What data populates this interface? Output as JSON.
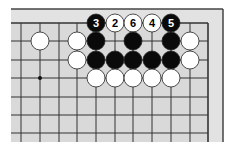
{
  "diagram": {
    "type": "go-board-fragment",
    "colors": {
      "page_bg": "#ffffff",
      "board_bg": "#d9d9d9",
      "margin_bg": "#e2e2e2",
      "grid_line": "#333333",
      "frame_line": "#444444",
      "black_stone": "#0a0a0a",
      "white_stone": "#ffffff",
      "stone_outline": "#222222"
    },
    "geometry": {
      "col_x": [
        21,
        40,
        59,
        77,
        96,
        115,
        133,
        152,
        171,
        190,
        208
      ],
      "row_y": [
        23,
        41,
        60,
        78,
        97,
        115,
        133
      ],
      "stone_radius": 9,
      "board_left": 11,
      "board_top": 9,
      "board_right": 223,
      "board_bottom": 142,
      "grid_bottom": 142
    },
    "edges": {
      "top": true,
      "right": true
    },
    "hoshi": [
      {
        "col": 1,
        "row": 3
      }
    ],
    "stones": [
      {
        "col": 4,
        "row": 0,
        "color": "black",
        "label": "3"
      },
      {
        "col": 5,
        "row": 0,
        "color": "white",
        "label": "2"
      },
      {
        "col": 6,
        "row": 0,
        "color": "white",
        "label": "6"
      },
      {
        "col": 7,
        "row": 0,
        "color": "white",
        "label": "4"
      },
      {
        "col": 8,
        "row": 0,
        "color": "black",
        "label": "5"
      },
      {
        "col": 1,
        "row": 1,
        "color": "white",
        "label": ""
      },
      {
        "col": 3,
        "row": 1,
        "color": "white",
        "label": ""
      },
      {
        "col": 4,
        "row": 1,
        "color": "black",
        "label": ""
      },
      {
        "col": 6,
        "row": 1,
        "color": "black",
        "label": ""
      },
      {
        "col": 8,
        "row": 1,
        "color": "black",
        "label": ""
      },
      {
        "col": 9,
        "row": 1,
        "color": "white",
        "label": ""
      },
      {
        "col": 3,
        "row": 2,
        "color": "white",
        "label": ""
      },
      {
        "col": 4,
        "row": 2,
        "color": "black",
        "label": ""
      },
      {
        "col": 5,
        "row": 2,
        "color": "black",
        "label": ""
      },
      {
        "col": 6,
        "row": 2,
        "color": "black",
        "label": ""
      },
      {
        "col": 7,
        "row": 2,
        "color": "black",
        "label": ""
      },
      {
        "col": 8,
        "row": 2,
        "color": "black",
        "label": ""
      },
      {
        "col": 9,
        "row": 2,
        "color": "white",
        "label": ""
      },
      {
        "col": 4,
        "row": 3,
        "color": "white",
        "label": ""
      },
      {
        "col": 5,
        "row": 3,
        "color": "white",
        "label": ""
      },
      {
        "col": 6,
        "row": 3,
        "color": "white",
        "label": ""
      },
      {
        "col": 7,
        "row": 3,
        "color": "white",
        "label": ""
      },
      {
        "col": 8,
        "row": 3,
        "color": "white",
        "label": ""
      }
    ]
  }
}
